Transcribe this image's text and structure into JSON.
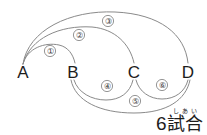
{
  "diagram": {
    "type": "round-robin-match-graph",
    "nodes": [
      {
        "id": "A",
        "label": "A",
        "x": 23,
        "y": 72
      },
      {
        "id": "B",
        "label": "B",
        "x": 73,
        "y": 72
      },
      {
        "id": "C",
        "label": "C",
        "x": 134,
        "y": 72
      },
      {
        "id": "D",
        "label": "D",
        "x": 188,
        "y": 72
      }
    ],
    "edges": [
      {
        "id": "e1",
        "badge": "①",
        "from": "A",
        "to": "B",
        "side": "above",
        "badge_x": 50,
        "badge_y": 51
      },
      {
        "id": "e2",
        "badge": "②",
        "from": "A",
        "to": "C",
        "side": "above",
        "badge_x": 79,
        "badge_y": 35
      },
      {
        "id": "e3",
        "badge": "③",
        "from": "A",
        "to": "D",
        "side": "above",
        "badge_x": 108,
        "badge_y": 21
      },
      {
        "id": "e4",
        "badge": "④",
        "from": "B",
        "to": "C",
        "side": "below",
        "badge_x": 107,
        "badge_y": 86
      },
      {
        "id": "e5",
        "badge": "⑤",
        "from": "B",
        "to": "D",
        "side": "below",
        "badge_x": 135,
        "badge_y": 101
      },
      {
        "id": "e6",
        "badge": "⑥",
        "from": "C",
        "to": "D",
        "side": "below",
        "badge_x": 162,
        "badge_y": 85
      }
    ]
  },
  "caption": {
    "count": "6",
    "word": "試合",
    "furigana": "しあい",
    "full_text": "6試合"
  },
  "colors": {
    "background": "#ffffff",
    "ink": "#1d1d1d",
    "edge": "#8a8a8a",
    "badge_text": "#3a3a3a"
  }
}
